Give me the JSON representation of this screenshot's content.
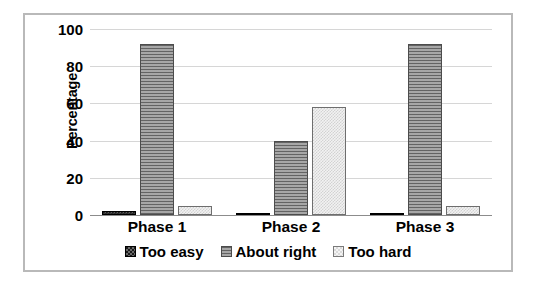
{
  "chart_data": {
    "type": "bar",
    "title": "",
    "subtitle": "",
    "xlabel": "",
    "ylabel": "Percentage",
    "categories": [
      "Phase 1",
      "Phase 2",
      "Phase 3"
    ],
    "series": [
      {
        "name": "Too easy",
        "values": [
          2,
          1,
          1
        ],
        "swatch": "dark-checker",
        "color": "#1c1c1c"
      },
      {
        "name": "About right",
        "values": [
          92,
          40,
          92
        ],
        "swatch": "gray-hlines",
        "color": "#8e8e8e"
      },
      {
        "name": "Too hard",
        "values": [
          5,
          58,
          5
        ],
        "swatch": "light-checker",
        "color": "#f2f2f2"
      }
    ],
    "ylim": [
      0,
      100
    ],
    "ytick_labels": [
      "0",
      "20",
      "40",
      "60",
      "80",
      "100"
    ],
    "ytick_values": [
      0,
      20,
      40,
      60,
      80,
      100
    ],
    "grid": "horizontal",
    "legend_position": "bottom",
    "annotations": []
  },
  "legend": {
    "items": [
      {
        "label": "Too easy"
      },
      {
        "label": "About right"
      },
      {
        "label": "Too hard"
      }
    ]
  },
  "axes": {
    "y_title": "Percentage"
  }
}
